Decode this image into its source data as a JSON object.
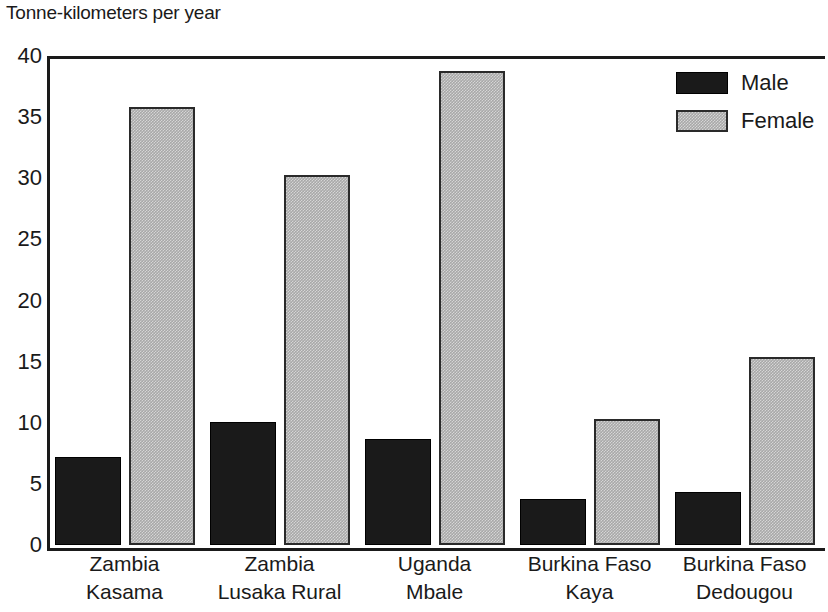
{
  "chart_data": {
    "type": "bar",
    "title": "Tonne-kilometers per year",
    "xlabel": "",
    "ylabel": "",
    "ylim": [
      0,
      40
    ],
    "yticks": [
      0,
      5,
      10,
      15,
      20,
      25,
      30,
      35,
      40
    ],
    "ytick_labels": [
      "0",
      "5",
      "10",
      "15",
      "20",
      "25",
      "30",
      "35",
      "40"
    ],
    "grid": false,
    "legend_position": "top-right",
    "categories": [
      "Zambia Kasama",
      "Zambia Lusaka Rural",
      "Uganda Mbale",
      "Burkina Faso Kaya",
      "Burkina Faso Dedougou"
    ],
    "category_lines": [
      {
        "line1": "Zambia",
        "line2": "Kasama"
      },
      {
        "line1": "Zambia",
        "line2": "Lusaka Rural"
      },
      {
        "line1": "Uganda",
        "line2": "Mbale"
      },
      {
        "line1": "Burkina Faso",
        "line2": "Kaya"
      },
      {
        "line1": "Burkina Faso",
        "line2": "Dedougou"
      }
    ],
    "series": [
      {
        "name": "Male",
        "color": "#1a1a1a",
        "values": [
          7.2,
          10.1,
          8.7,
          3.8,
          4.3
        ]
      },
      {
        "name": "Female",
        "color": "#a8a8a8",
        "values": [
          35.8,
          30.3,
          38.8,
          10.3,
          15.4
        ]
      }
    ]
  },
  "legend": {
    "items": [
      {
        "label": "Male",
        "key": "male"
      },
      {
        "label": "Female",
        "key": "female"
      }
    ]
  }
}
